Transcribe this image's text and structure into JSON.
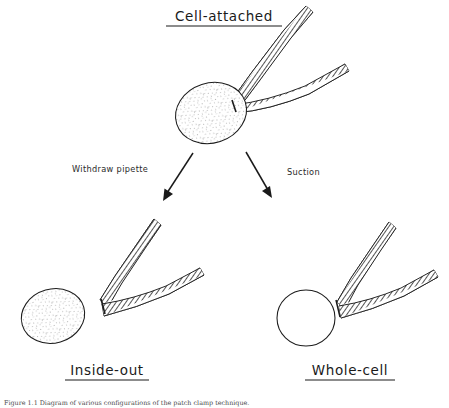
{
  "figure": {
    "caption": "Figure 1.1  Diagram of various configurations of the patch clamp technique.",
    "background_color": "#ffffff",
    "ink_color": "#1a1a1a"
  },
  "panels": [
    {
      "id": "cell-attached",
      "title": "Cell-attached",
      "underlined": true,
      "cell": {
        "shape": "oval",
        "fill_style": "stippled",
        "cx": 211,
        "cy": 113,
        "rx": 36,
        "ry": 30,
        "rotation": -18
      },
      "pipette_count": 2
    },
    {
      "id": "inside-out",
      "title": "Inside-out",
      "underlined": true,
      "cell": {
        "shape": "oval",
        "fill_style": "stippled",
        "cx": 53,
        "cy": 316,
        "rx": 32,
        "ry": 27,
        "rotation": -16
      },
      "pipette_count": 2
    },
    {
      "id": "whole-cell",
      "title": "Whole-cell",
      "underlined": true,
      "cell": {
        "shape": "circle",
        "fill_style": "open",
        "cx": 306,
        "cy": 318,
        "rx": 29,
        "ry": 28,
        "rotation": 0
      },
      "pipette_count": 2
    }
  ],
  "transitions": [
    {
      "id": "withdraw-pipette",
      "label": "Withdraw pipette",
      "direction": "down-left",
      "from": [
        193,
        153
      ],
      "to": [
        163,
        200
      ]
    },
    {
      "id": "suction",
      "label": "Suction",
      "direction": "down-right",
      "from": [
        246,
        152
      ],
      "to": [
        272,
        197
      ]
    }
  ],
  "labels": {
    "title_cell_attached": "Cell-attached",
    "title_inside_out": "Inside-out",
    "title_whole_cell": "Whole-cell",
    "arrow_left": "Withdraw pipette",
    "arrow_right": "Suction"
  }
}
